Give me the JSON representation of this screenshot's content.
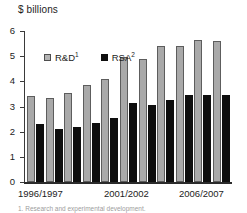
{
  "chart_data": {
    "type": "bar",
    "title": "",
    "ylabel": "$ billions",
    "xlabel": "",
    "ylim": [
      0,
      6
    ],
    "yticks": [
      0,
      1,
      2,
      3,
      4,
      5,
      6
    ],
    "ytick_labels": [
      "0",
      "1",
      "2",
      "3",
      "4",
      "5",
      "6"
    ],
    "grid": false,
    "legend_position": "upper left inside",
    "categories": [
      "1996/1997",
      "1997/1998",
      "1998/1999",
      "1999/2000",
      "2000/2001",
      "2001/2002",
      "2002/2003",
      "2003/2004",
      "2004/2005",
      "2005/2006",
      "2006/2007"
    ],
    "visible_tick_labels": [
      "1996/1997",
      "2001/2002",
      "2006/2007"
    ],
    "series": [
      {
        "name": "R&D¹",
        "label_text": "R&D",
        "label_sup": "1",
        "color": "#a9a9a9",
        "values": [
          3.4,
          3.35,
          3.55,
          3.85,
          4.1,
          4.95,
          4.9,
          5.4,
          5.4,
          5.65,
          5.6
        ]
      },
      {
        "name": "RSA²",
        "label_text": "RSA",
        "label_sup": "2",
        "color": "#0e0e0e",
        "values": [
          2.3,
          2.1,
          2.2,
          2.35,
          2.55,
          3.15,
          3.05,
          3.25,
          3.45,
          3.45,
          3.45
        ]
      }
    ]
  },
  "axis": {
    "y_title": "$ billions"
  },
  "xaxis": {
    "labels": [
      {
        "text": "1996/1997",
        "left": 18
      },
      {
        "text": "2001/2002",
        "left": 104
      },
      {
        "text": "2006/2007",
        "left": 179
      }
    ]
  },
  "legend": {
    "items": [
      {
        "label_text": "R&D",
        "label_sup": "1",
        "swatch": "rd"
      },
      {
        "label_text": "RSA",
        "label_sup": "2",
        "swatch": "rsa"
      }
    ]
  },
  "footnote": {
    "text": "1. Research and experimental development."
  },
  "colors": {
    "rd_fill": "#a9a9a9",
    "rd_stroke": "#5d5d5d",
    "rsa_fill": "#0e0e0e",
    "axis": "#2b2b2b",
    "text": "#1c1c1c",
    "background": "#ffffff"
  }
}
